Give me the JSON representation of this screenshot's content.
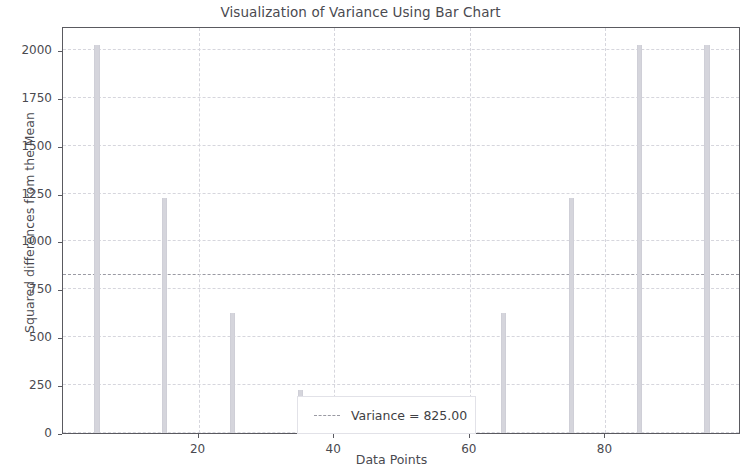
{
  "chart_data": {
    "type": "bar",
    "title": "Visualization of Variance Using Bar Chart",
    "xlabel": "Data Points",
    "ylabel": "Squared differences from the Mean",
    "x": [
      5,
      15,
      25,
      35,
      45,
      50,
      55,
      65,
      75,
      85,
      95
    ],
    "values": [
      2025,
      1225,
      625,
      225,
      25,
      5,
      25,
      625,
      1225,
      2025,
      2025
    ],
    "xlim": [
      0,
      100
    ],
    "ylim": [
      0,
      2125
    ],
    "xticks": [
      20,
      40,
      60,
      80
    ],
    "xtick_labels": [
      "20",
      "40",
      "60",
      "80"
    ],
    "yticks": [
      0,
      250,
      500,
      750,
      1000,
      1250,
      1500,
      1750,
      2000
    ],
    "ytick_labels": [
      "0",
      "250",
      "500",
      "750",
      "1000",
      "1250",
      "1500",
      "1750",
      "2000"
    ],
    "grid": true,
    "legend_position": "lower center",
    "bar_color": "#d5d5dc",
    "annotations": [
      {
        "type": "hline",
        "label": "Variance = 825.00",
        "value": 825,
        "style": "dashed",
        "color": "#9a9aa3"
      }
    ],
    "legend": [
      {
        "label": "Variance = 825.00",
        "marker": "dashed-line",
        "color": "#9a9aa3"
      }
    ]
  }
}
